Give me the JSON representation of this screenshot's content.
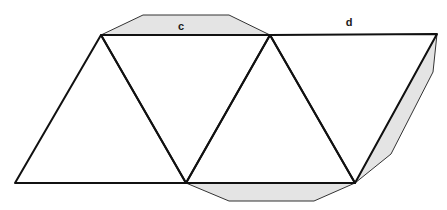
{
  "diagram": {
    "type": "net-of-polyhedron",
    "colors": {
      "background": "#ffffff",
      "edge": "#111111",
      "tab_fill": "#e4e4e4",
      "tab_edge": "#333333"
    },
    "vertices": {
      "A": [
        101,
        35
      ],
      "B": [
        270,
        35
      ],
      "C": [
        437,
        34
      ],
      "D": [
        15,
        183
      ],
      "E": [
        186,
        183
      ],
      "F": [
        355,
        183
      ]
    },
    "triangles": [
      [
        "D",
        "A",
        "E"
      ],
      [
        "A",
        "B",
        "E"
      ],
      [
        "E",
        "B",
        "F"
      ],
      [
        "B",
        "C",
        "F"
      ]
    ],
    "tabs": [
      {
        "name": "top-tab",
        "points": [
          [
            101,
            35
          ],
          [
            143,
            15
          ],
          [
            229,
            15
          ],
          [
            270,
            35
          ]
        ]
      },
      {
        "name": "bottom-tab",
        "points": [
          [
            186,
            183
          ],
          [
            229,
            201
          ],
          [
            314,
            201
          ],
          [
            355,
            183
          ]
        ]
      },
      {
        "name": "right-tab",
        "points": [
          [
            437,
            34
          ],
          [
            433,
            72
          ],
          [
            391,
            154
          ],
          [
            355,
            183
          ]
        ]
      }
    ],
    "labels": [
      {
        "text": "c",
        "x": 181,
        "y": 26
      },
      {
        "text": "d",
        "x": 349,
        "y": 22
      }
    ]
  }
}
